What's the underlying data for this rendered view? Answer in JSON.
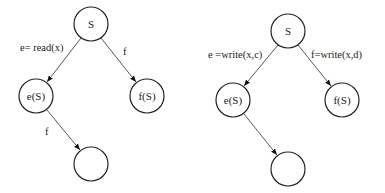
{
  "diagrams": [
    {
      "name": "read-write-tree",
      "nodes": [
        {
          "id": "root",
          "label": "S",
          "cx": 91,
          "cy": 24
        },
        {
          "id": "left",
          "label": "e(S)",
          "cx": 36,
          "cy": 96
        },
        {
          "id": "right",
          "label": "f(S)",
          "cx": 147,
          "cy": 96
        },
        {
          "id": "bottom",
          "label": "",
          "cx": 91,
          "cy": 164
        }
      ],
      "edges": [
        {
          "from": "root",
          "to": "left",
          "label": "e= read(x)",
          "lx": 20,
          "ly": 51
        },
        {
          "from": "root",
          "to": "right",
          "label": "f",
          "lx": 123,
          "ly": 55
        },
        {
          "from": "left",
          "to": "bottom",
          "label": "f",
          "lx": 45,
          "ly": 135
        }
      ]
    },
    {
      "name": "write-write-tree",
      "nodes": [
        {
          "id": "root",
          "label": "S",
          "cx": 288,
          "cy": 31
        },
        {
          "id": "left",
          "label": "e(S)",
          "cx": 233,
          "cy": 100
        },
        {
          "id": "right",
          "label": "f(S)",
          "cx": 342,
          "cy": 100
        },
        {
          "id": "bottom",
          "label": "",
          "cx": 288,
          "cy": 169
        }
      ],
      "edges": [
        {
          "from": "root",
          "to": "left",
          "label": "e =write(x,c)",
          "lx": 208,
          "ly": 58
        },
        {
          "from": "root",
          "to": "right",
          "label": "f=write(x,d)",
          "lx": 311,
          "ly": 58
        },
        {
          "from": "left",
          "to": "bottom",
          "label": "",
          "lx": 0,
          "ly": 0
        }
      ]
    }
  ],
  "style": {
    "node_radius": 17,
    "stroke_color": "#222222",
    "edge_color": "#444444",
    "background": "#ffffff"
  }
}
